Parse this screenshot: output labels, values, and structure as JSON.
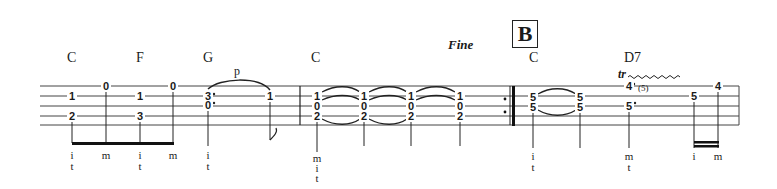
{
  "rehearsal_mark": "B",
  "fine_label": "Fine",
  "pull_off_label": "p",
  "trill_label": "tr",
  "trill_aux": "(5)",
  "chords": [
    {
      "name": "C",
      "x": 67
    },
    {
      "name": "F",
      "x": 136
    },
    {
      "name": "G",
      "x": 203
    },
    {
      "name": "C",
      "x": 311
    },
    {
      "name": "C",
      "x": 529
    },
    {
      "name": "D7",
      "x": 624
    }
  ],
  "notes": [
    {
      "x": 72,
      "frets": [
        {
          "string": 2,
          "fret": "1"
        },
        {
          "string": 4,
          "fret": "2"
        }
      ],
      "fingering": [
        "i",
        "t"
      ]
    },
    {
      "x": 106,
      "frets": [
        {
          "string": 1,
          "fret": "0"
        }
      ],
      "fingering": [
        "m"
      ]
    },
    {
      "x": 140,
      "frets": [
        {
          "string": 2,
          "fret": "1"
        },
        {
          "string": 4,
          "fret": "3"
        }
      ],
      "fingering": [
        "i",
        "t"
      ]
    },
    {
      "x": 173,
      "frets": [
        {
          "string": 1,
          "fret": "0"
        }
      ],
      "fingering": [
        "m"
      ]
    },
    {
      "x": 208,
      "frets": [
        {
          "string": 2,
          "fret": "3"
        },
        {
          "string": 3,
          "fret": "0"
        }
      ],
      "fingering": [
        "i",
        "t"
      ]
    },
    {
      "x": 270,
      "frets": [
        {
          "string": 2,
          "fret": "1"
        }
      ],
      "fingering": []
    },
    {
      "x": 317,
      "frets": [
        {
          "string": 2,
          "fret": "1"
        },
        {
          "string": 3,
          "fret": "0"
        },
        {
          "string": 4,
          "fret": "2"
        }
      ],
      "fingering": [
        "m",
        "i",
        "t"
      ]
    },
    {
      "x": 364,
      "frets": [
        {
          "string": 2,
          "fret": "1"
        },
        {
          "string": 3,
          "fret": "0"
        },
        {
          "string": 4,
          "fret": "2"
        }
      ],
      "fingering": []
    },
    {
      "x": 411,
      "frets": [
        {
          "string": 2,
          "fret": "1"
        },
        {
          "string": 3,
          "fret": "0"
        },
        {
          "string": 4,
          "fret": "2"
        }
      ],
      "fingering": []
    },
    {
      "x": 460,
      "frets": [
        {
          "string": 2,
          "fret": "1"
        },
        {
          "string": 3,
          "fret": "0"
        },
        {
          "string": 4,
          "fret": "2"
        }
      ],
      "fingering": []
    },
    {
      "x": 533,
      "frets": [
        {
          "string": 2,
          "fret": "5"
        },
        {
          "string": 3,
          "fret": "5"
        }
      ],
      "fingering": [
        "i",
        "t"
      ]
    },
    {
      "x": 580,
      "frets": [
        {
          "string": 2,
          "fret": "5"
        },
        {
          "string": 3,
          "fret": "5"
        }
      ],
      "fingering": []
    },
    {
      "x": 629,
      "frets": [
        {
          "string": 1,
          "fret": "4"
        },
        {
          "string": 3,
          "fret": "5"
        }
      ],
      "fingering": [
        "m",
        "t"
      ]
    },
    {
      "x": 694,
      "frets": [
        {
          "string": 2,
          "fret": "5"
        }
      ],
      "fingering": [
        "i"
      ]
    },
    {
      "x": 718,
      "frets": [
        {
          "string": 1,
          "fret": "4"
        }
      ],
      "fingering": [
        "m"
      ]
    }
  ]
}
